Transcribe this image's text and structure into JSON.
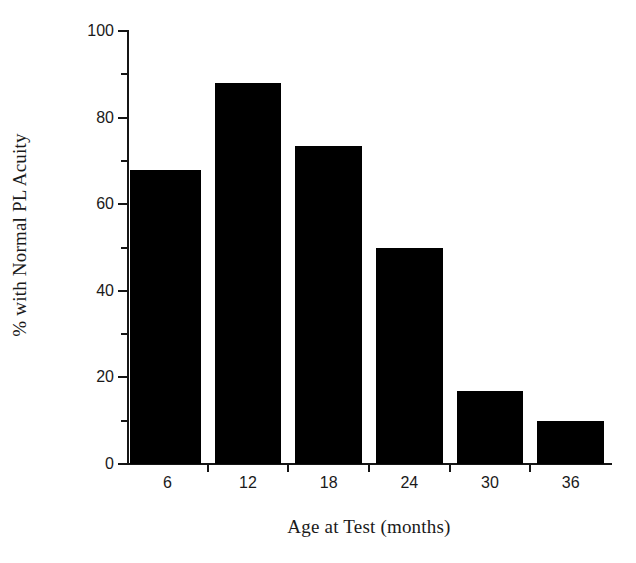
{
  "chart_data": {
    "type": "bar",
    "title": "",
    "xlabel": "Age at Test (months)",
    "ylabel": "% with Normal PL Acuity",
    "categories": [
      "6",
      "12",
      "18",
      "24",
      "30",
      "36"
    ],
    "values": [
      68,
      88,
      73.5,
      50,
      16.8,
      10
    ],
    "ylim": [
      0,
      100
    ],
    "y_ticks_major": [
      "0",
      "20",
      "40",
      "60",
      "80",
      "100"
    ],
    "y_ticks_major_values": [
      0,
      20,
      40,
      60,
      80,
      100
    ],
    "y_ticks_minor_values": [
      10,
      30,
      50,
      70,
      90
    ],
    "grid": false,
    "legend": "none",
    "bar_color": "#000000",
    "axis_color": "#151515",
    "background_color": "#ffffff"
  }
}
